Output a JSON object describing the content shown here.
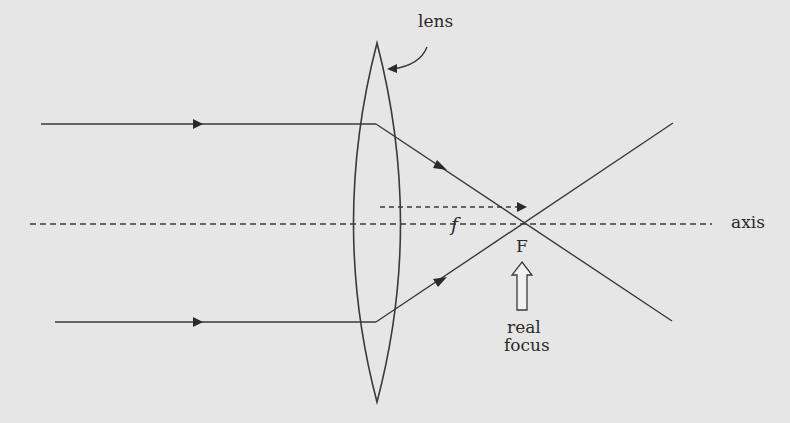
{
  "diagram": {
    "labels": {
      "lens": "lens",
      "axis": "axis",
      "focal_length": "f",
      "focal_point": "F",
      "real_focus_line1": "real",
      "real_focus_line2": "focus"
    },
    "colors": {
      "background": "#e6e6e6",
      "stroke": "#3a3a3a"
    }
  }
}
